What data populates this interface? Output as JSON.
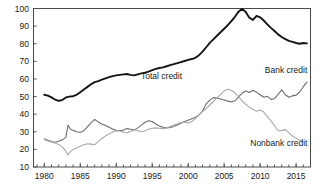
{
  "chart_data": {
    "type": "line",
    "title": "",
    "subtitle": "",
    "xlabel": "",
    "ylabel": "",
    "xlim": [
      1978.5,
      2017.0
    ],
    "ylim": [
      10,
      100
    ],
    "grid": false,
    "legend": "inline-annotations",
    "xticks": [
      "1980",
      "1985",
      "1990",
      "1995",
      "2000",
      "2005",
      "2010",
      "2015"
    ],
    "xtick_values": [
      1980,
      1985,
      1990,
      1995,
      2000,
      2005,
      2010,
      2015
    ],
    "yticks": [
      "10",
      "20",
      "30",
      "40",
      "50",
      "60",
      "70",
      "80",
      "90",
      "100"
    ],
    "ytick_values": [
      10,
      20,
      30,
      40,
      50,
      60,
      70,
      80,
      90,
      100
    ],
    "minor_xtick_interval": 1,
    "annotations": [
      {
        "text": "Total credit",
        "x": 1996.3,
        "y": 60.0,
        "series": "Total credit"
      },
      {
        "text": "Bank credit",
        "x": 2013.6,
        "y": 63.5,
        "series": "Bank credit"
      },
      {
        "text": "Nonbank credit",
        "x": 2012.6,
        "y": 22.0,
        "series": "Nonbank credit"
      }
    ],
    "series": [
      {
        "name": "Total credit",
        "color": "#141414",
        "width": 1.9,
        "x": [
          1980.0,
          1980.5,
          1981.0,
          1981.5,
          1982.0,
          1982.5,
          1983.0,
          1983.5,
          1984.0,
          1984.5,
          1985.0,
          1985.5,
          1986.0,
          1986.5,
          1987.0,
          1987.5,
          1988.0,
          1988.5,
          1989.0,
          1989.5,
          1990.0,
          1990.5,
          1991.0,
          1991.5,
          1992.0,
          1992.5,
          1993.0,
          1993.5,
          1994.0,
          1994.5,
          1995.0,
          1995.5,
          1996.0,
          1996.5,
          1997.0,
          1997.5,
          1998.0,
          1998.5,
          1999.0,
          1999.5,
          2000.0,
          2000.5,
          2001.0,
          2001.5,
          2002.0,
          2002.5,
          2003.0,
          2003.5,
          2004.0,
          2004.5,
          2005.0,
          2005.5,
          2006.0,
          2006.5,
          2007.0,
          2007.5,
          2008.0,
          2008.5,
          2009.0,
          2009.5,
          2010.0,
          2010.5,
          2011.0,
          2011.5,
          2012.0,
          2012.5,
          2013.0,
          2013.5,
          2014.0,
          2014.5,
          2015.0,
          2015.5,
          2016.0,
          2016.5
        ],
        "y": [
          51.0,
          50.5,
          49.5,
          48.3,
          47.6,
          48.0,
          49.5,
          50.0,
          50.2,
          51.0,
          52.5,
          54.0,
          55.5,
          57.0,
          58.2,
          58.8,
          59.6,
          60.3,
          61.0,
          61.6,
          62.0,
          62.3,
          62.6,
          62.8,
          62.3,
          62.0,
          62.6,
          63.2,
          63.6,
          64.2,
          65.0,
          65.7,
          66.2,
          66.6,
          67.2,
          67.8,
          68.4,
          69.0,
          69.6,
          70.2,
          70.8,
          71.3,
          72.0,
          73.5,
          75.5,
          78.0,
          80.5,
          82.5,
          84.5,
          86.5,
          88.5,
          90.5,
          92.8,
          95.3,
          98.2,
          99.8,
          98.0,
          94.8,
          93.5,
          95.8,
          95.0,
          93.2,
          91.0,
          89.0,
          87.2,
          85.3,
          83.8,
          82.6,
          81.6,
          81.0,
          80.4,
          80.0,
          80.4,
          80.2
        ]
      },
      {
        "name": "Bank credit",
        "color": "#6e6e6e",
        "width": 1.1,
        "x": [
          1980.0,
          1980.5,
          1981.0,
          1981.5,
          1982.0,
          1982.5,
          1983.0,
          1983.3,
          1983.6,
          1984.0,
          1984.5,
          1985.0,
          1985.5,
          1986.0,
          1986.5,
          1987.0,
          1987.5,
          1988.0,
          1988.5,
          1989.0,
          1989.5,
          1990.0,
          1990.5,
          1991.0,
          1991.5,
          1992.0,
          1992.5,
          1993.0,
          1993.5,
          1994.0,
          1994.5,
          1995.0,
          1995.5,
          1996.0,
          1996.5,
          1997.0,
          1997.5,
          1998.0,
          1998.5,
          1999.0,
          1999.5,
          2000.0,
          2000.5,
          2001.0,
          2001.5,
          2002.0,
          2002.5,
          2003.0,
          2003.5,
          2004.0,
          2004.5,
          2005.0,
          2005.5,
          2006.0,
          2006.5,
          2007.0,
          2007.5,
          2008.0,
          2008.5,
          2009.0,
          2009.5,
          2010.0,
          2010.5,
          2011.0,
          2011.5,
          2012.0,
          2012.5,
          2013.0,
          2013.5,
          2014.0,
          2014.5,
          2015.0,
          2015.5,
          2016.0,
          2016.5
        ],
        "y": [
          26.0,
          25.2,
          24.5,
          24.0,
          24.6,
          25.4,
          26.8,
          33.8,
          31.6,
          30.8,
          30.0,
          29.6,
          30.6,
          32.8,
          35.0,
          37.0,
          35.6,
          34.4,
          33.6,
          32.6,
          31.6,
          30.8,
          30.6,
          31.0,
          31.8,
          31.4,
          31.0,
          32.2,
          33.8,
          35.4,
          36.2,
          35.8,
          34.4,
          33.2,
          32.6,
          32.2,
          32.4,
          33.0,
          33.8,
          34.8,
          35.8,
          36.6,
          37.4,
          38.2,
          39.6,
          41.8,
          45.8,
          48.0,
          49.4,
          49.2,
          48.6,
          48.0,
          47.4,
          47.0,
          47.6,
          49.8,
          52.0,
          53.2,
          52.3,
          53.6,
          52.4,
          51.0,
          49.6,
          50.2,
          48.4,
          48.8,
          51.2,
          53.8,
          51.0,
          49.6,
          50.4,
          50.8,
          52.6,
          55.6,
          58.2
        ]
      },
      {
        "name": "Nonbank credit",
        "color": "#a8a8a8",
        "width": 1.1,
        "x": [
          1980.0,
          1980.5,
          1981.0,
          1981.5,
          1982.0,
          1982.5,
          1983.0,
          1983.3,
          1983.6,
          1984.0,
          1984.5,
          1985.0,
          1985.5,
          1986.0,
          1986.5,
          1987.0,
          1987.5,
          1988.0,
          1988.5,
          1989.0,
          1989.5,
          1990.0,
          1990.5,
          1991.0,
          1991.5,
          1992.0,
          1992.5,
          1993.0,
          1993.5,
          1994.0,
          1994.5,
          1995.0,
          1995.5,
          1996.0,
          1996.5,
          1997.0,
          1997.5,
          1998.0,
          1998.5,
          1999.0,
          1999.5,
          2000.0,
          2000.5,
          2001.0,
          2001.5,
          2002.0,
          2002.5,
          2003.0,
          2003.5,
          2004.0,
          2004.5,
          2005.0,
          2005.5,
          2006.0,
          2006.5,
          2007.0,
          2007.5,
          2008.0,
          2008.5,
          2009.0,
          2009.5,
          2010.0,
          2010.5,
          2011.0,
          2011.5,
          2012.0,
          2012.5,
          2013.0,
          2013.5,
          2014.0,
          2014.5,
          2015.0,
          2015.5,
          2016.0
        ],
        "y": [
          25.6,
          24.8,
          24.2,
          23.6,
          22.8,
          21.4,
          19.0,
          16.8,
          18.6,
          20.0,
          20.8,
          21.8,
          22.6,
          23.2,
          23.0,
          22.6,
          24.4,
          26.2,
          27.6,
          28.8,
          29.8,
          30.6,
          30.4,
          29.8,
          29.4,
          30.2,
          31.2,
          30.6,
          30.0,
          30.6,
          31.4,
          32.0,
          32.2,
          32.0,
          31.8,
          32.2,
          33.0,
          33.8,
          34.6,
          35.2,
          35.4,
          35.0,
          35.8,
          37.4,
          39.6,
          41.4,
          43.2,
          45.2,
          47.2,
          49.2,
          51.2,
          53.2,
          54.2,
          53.6,
          52.0,
          50.0,
          47.6,
          45.6,
          44.0,
          42.8,
          41.6,
          42.4,
          41.2,
          38.6,
          36.2,
          33.4,
          30.6,
          30.8,
          31.2,
          29.4,
          27.6,
          26.4,
          25.2,
          24.6
        ]
      }
    ]
  },
  "frame": {
    "border_color": "#4a4a4a"
  }
}
